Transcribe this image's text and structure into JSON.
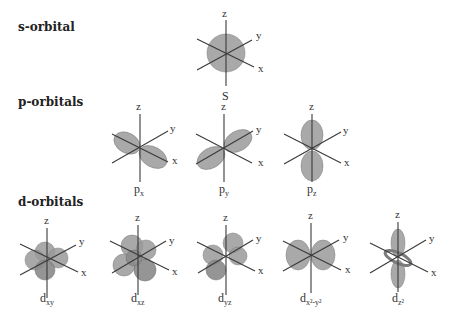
{
  "sections": {
    "s": {
      "title": "s-orbital"
    },
    "p": {
      "title": "p-orbitals"
    },
    "d": {
      "title": "d-orbitals"
    }
  },
  "axes": {
    "x": "x",
    "y": "y",
    "z": "z"
  },
  "orbitals": {
    "s": {
      "label": "S",
      "sub": ""
    },
    "px": {
      "label": "p",
      "sub": "x"
    },
    "py": {
      "label": "p",
      "sub": "y"
    },
    "pz": {
      "label": "p",
      "sub": "z"
    },
    "dxy": {
      "label": "d",
      "sub": "xy"
    },
    "dxz": {
      "label": "d",
      "sub": "xz"
    },
    "dyz": {
      "label": "d",
      "sub": "yz"
    },
    "dx2y2": {
      "label": "d",
      "sub": "x²-y²"
    },
    "dz2": {
      "label": "d",
      "sub": "z²"
    }
  },
  "colors": {
    "lobe": "#9a9a9a",
    "axis": "#3a3a3a",
    "text": "#2a2a2a",
    "background": "#ffffff"
  }
}
